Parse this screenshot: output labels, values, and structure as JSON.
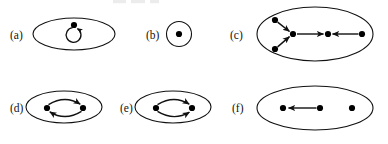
{
  "figure": {
    "kind": "graph-diagram-figure",
    "background_color": "#ffffff",
    "stroke_color": "#111111",
    "node_fill_color": "#000000",
    "width": 388,
    "height": 144,
    "top_cropped_text": "",
    "panels": [
      {
        "id": "a",
        "label": "(a)",
        "label_x": 10,
        "label_y": 40,
        "container": {
          "shape": "ellipse",
          "cx": 74,
          "cy": 34,
          "rx": 41,
          "ry": 16
        },
        "nodes": [
          {
            "id": "a1",
            "cx": 74,
            "cy": 25,
            "r": 3.1
          }
        ],
        "edges": [
          {
            "from": "a1",
            "to": "a1",
            "type": "self-loop",
            "direction": "counterclockwise",
            "arrowhead": true
          }
        ],
        "description": "single node with a self-loop inside an ellipse"
      },
      {
        "id": "b",
        "label": "(b)",
        "label_x": 146,
        "label_y": 40,
        "container": {
          "shape": "circle",
          "cx": 179,
          "cy": 34,
          "rx": 12.5,
          "ry": 12.5
        },
        "nodes": [
          {
            "id": "b1",
            "cx": 179,
            "cy": 34,
            "r": 3.1
          }
        ],
        "edges": [],
        "description": "single isolated node inside a small circle"
      },
      {
        "id": "c",
        "label": "(c)",
        "label_x": 230,
        "label_y": 40,
        "container": {
          "shape": "ellipse",
          "cx": 315,
          "cy": 34,
          "rx": 58,
          "ry": 27
        },
        "nodes": [
          {
            "id": "c1",
            "cx": 275,
            "cy": 20,
            "r": 3.1
          },
          {
            "id": "c2",
            "cx": 275,
            "cy": 49,
            "r": 3.1
          },
          {
            "id": "c3",
            "cx": 293,
            "cy": 34,
            "r": 3.1
          },
          {
            "id": "c4",
            "cx": 328,
            "cy": 34,
            "r": 3.1
          },
          {
            "id": "c5",
            "cx": 362,
            "cy": 34,
            "r": 3.1
          }
        ],
        "edges": [
          {
            "from": "c1",
            "to": "c3",
            "type": "straight",
            "arrowhead": true
          },
          {
            "from": "c2",
            "to": "c3",
            "type": "straight",
            "arrowhead": true
          },
          {
            "from": "c3",
            "to": "c4",
            "type": "straight",
            "arrowhead": true
          },
          {
            "from": "c5",
            "to": "c4",
            "type": "straight",
            "arrowhead": true
          }
        ],
        "description": "five nodes: two feed a hub, hub points right, rightmost node points left"
      },
      {
        "id": "d",
        "label": "(d)",
        "label_x": 10,
        "label_y": 112,
        "container": {
          "shape": "ellipse",
          "cx": 64,
          "cy": 107,
          "rx": 38,
          "ry": 16
        },
        "nodes": [
          {
            "id": "d1",
            "cx": 47,
            "cy": 108,
            "r": 3.1
          },
          {
            "id": "d2",
            "cx": 83,
            "cy": 108,
            "r": 3.1
          }
        ],
        "edges": [
          {
            "from": "d1",
            "to": "d2",
            "type": "curve-top",
            "arrowhead": true
          },
          {
            "from": "d2",
            "to": "d1",
            "type": "curve-bottom",
            "arrowhead": true
          }
        ],
        "description": "two nodes forming a two-cycle with curved arrows in both directions"
      },
      {
        "id": "e",
        "label": "(e)",
        "label_x": 120,
        "label_y": 112,
        "container": {
          "shape": "ellipse",
          "cx": 173,
          "cy": 107,
          "rx": 38,
          "ry": 16
        },
        "nodes": [
          {
            "id": "e1",
            "cx": 156,
            "cy": 108,
            "r": 3.1
          },
          {
            "id": "e2",
            "cx": 192,
            "cy": 108,
            "r": 3.1
          }
        ],
        "edges": [
          {
            "from": "e1",
            "to": "e2",
            "type": "curve-top",
            "arrowhead": true
          },
          {
            "from": "e1",
            "to": "e2",
            "type": "curve-bottom",
            "arrowhead": true
          }
        ],
        "description": "two nodes with two parallel curved arrows both pointing to the right node"
      },
      {
        "id": "f",
        "label": "(f)",
        "label_x": 232,
        "label_y": 112,
        "container": {
          "shape": "ellipse",
          "cx": 315,
          "cy": 108,
          "rx": 58,
          "ry": 22
        },
        "nodes": [
          {
            "id": "f1",
            "cx": 283,
            "cy": 108,
            "r": 3.1
          },
          {
            "id": "f2",
            "cx": 320,
            "cy": 108,
            "r": 3.1
          },
          {
            "id": "f3",
            "cx": 352,
            "cy": 108,
            "r": 3.1
          }
        ],
        "edges": [
          {
            "from": "f2",
            "to": "f1",
            "type": "straight",
            "arrowhead": true
          }
        ],
        "description": "three nodes: middle points left to first node, third node isolated"
      }
    ]
  }
}
